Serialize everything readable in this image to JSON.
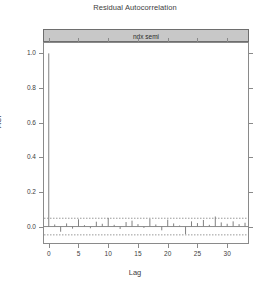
{
  "chart_data": {
    "type": "bar",
    "title": "Residual Autocorrelation",
    "panel_label": "ndx semi",
    "xlabel": "Lag",
    "ylabel": "ACF",
    "xlim": [
      -0.8,
      33.5
    ],
    "ylim": [
      -0.095,
      1.06
    ],
    "xticks": [
      0,
      5,
      10,
      15,
      20,
      25,
      30
    ],
    "yticks": [
      0.0,
      0.2,
      0.4,
      0.6,
      0.8,
      1.0
    ],
    "xtick_labels": [
      "0",
      "5",
      "10",
      "15",
      "20",
      "25",
      "30"
    ],
    "ytick_labels": [
      "0.0",
      "0.2",
      "0.4",
      "0.6",
      "0.8",
      "1.0"
    ],
    "grid": false,
    "legend": "none",
    "series_name": "ACF",
    "confidence_band": [
      -0.048,
      0.048
    ],
    "confidence_style": "dashed",
    "zero_line": 0.0,
    "spike_color": "#808080",
    "band_color": "#9a9a9a",
    "axis_color": "#8a8a8a",
    "strip_color": "#c8c8c8",
    "strip_border_color": "#6e6e6e",
    "text_color": "#3d3d3d",
    "x": [
      0,
      1,
      2,
      3,
      4,
      5,
      6,
      7,
      8,
      9,
      10,
      11,
      12,
      13,
      14,
      15,
      16,
      17,
      18,
      19,
      20,
      21,
      22,
      23,
      24,
      25,
      26,
      27,
      28,
      29,
      30,
      31,
      32,
      33
    ],
    "values": [
      1.0,
      0.012,
      -0.03,
      0.018,
      -0.012,
      0.042,
      0.008,
      -0.01,
      0.028,
      0.016,
      0.05,
      0.01,
      -0.014,
      0.026,
      0.034,
      0.014,
      -0.008,
      0.044,
      0.012,
      -0.022,
      0.04,
      0.018,
      0.006,
      -0.044,
      0.03,
      0.02,
      0.038,
      0.01,
      0.058,
      0.024,
      0.016,
      0.03,
      0.014,
      0.022
    ]
  }
}
